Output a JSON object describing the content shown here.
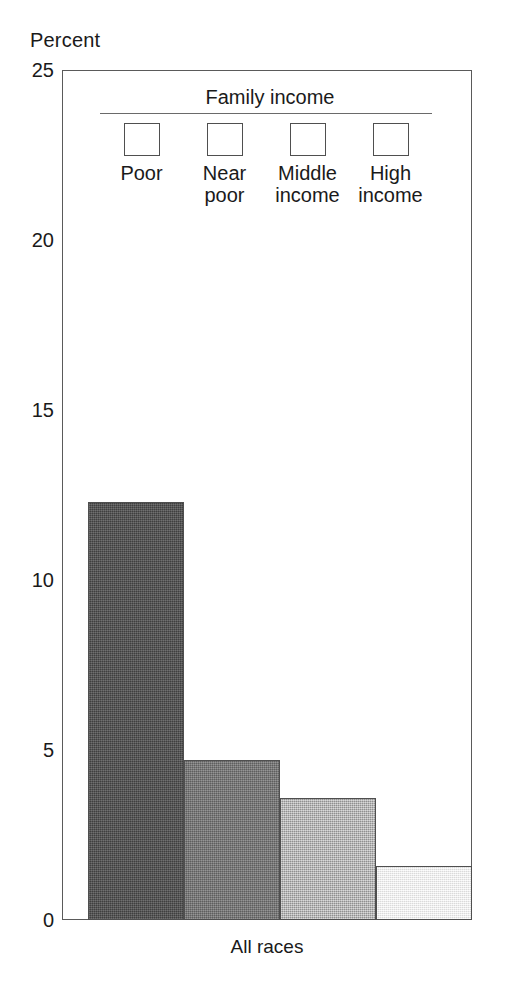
{
  "chart_data": {
    "type": "bar",
    "title": "",
    "subtitle": "",
    "xlabel": "All races",
    "ylabel": "Percent",
    "ylim": [
      0,
      25
    ],
    "yticks": [
      0,
      5,
      10,
      15,
      20,
      25
    ],
    "ytick_labels": [
      "0",
      "5",
      "10",
      "15",
      "20",
      "25"
    ],
    "grid": false,
    "legend_position": "top-inside",
    "legend_title": "Family income",
    "categories": [
      "All races"
    ],
    "series": [
      {
        "name": "Poor",
        "values": [
          12.3
        ],
        "color": "#4e4e4e"
      },
      {
        "name": "Near poor",
        "values": [
          4.7
        ],
        "color": "#757575"
      },
      {
        "name": "Middle income",
        "values": [
          3.6
        ],
        "color": "#b2b2b2"
      },
      {
        "name": "High income",
        "values": [
          1.6
        ],
        "color": "#f2f2f2"
      }
    ]
  },
  "axis": {
    "y_title": "Percent",
    "x_category_label": "All races"
  },
  "legend": {
    "title": "Family income",
    "items": [
      {
        "label": "Poor",
        "color": "#4e4e4e",
        "fill_class": "fill-poor"
      },
      {
        "label": "Near\npoor",
        "color": "#757575",
        "fill_class": "fill-near-poor"
      },
      {
        "label": "Middle\nincome",
        "color": "#b2b2b2",
        "fill_class": "fill-middle-income"
      },
      {
        "label": "High\nincome",
        "color": "#f2f2f2",
        "fill_class": "fill-high-income"
      }
    ]
  },
  "bars": [
    {
      "name": "bar-poor",
      "label": "Poor",
      "value": 12.3,
      "fill_class": "fill-poor"
    },
    {
      "name": "bar-near-poor",
      "label": "Near poor",
      "value": 4.7,
      "fill_class": "fill-near-poor"
    },
    {
      "name": "bar-middle-income",
      "label": "Middle income",
      "value": 3.6,
      "fill_class": "fill-middle-income"
    },
    {
      "name": "bar-high-income",
      "label": "High income",
      "value": 1.6,
      "fill_class": "fill-high-income"
    }
  ]
}
